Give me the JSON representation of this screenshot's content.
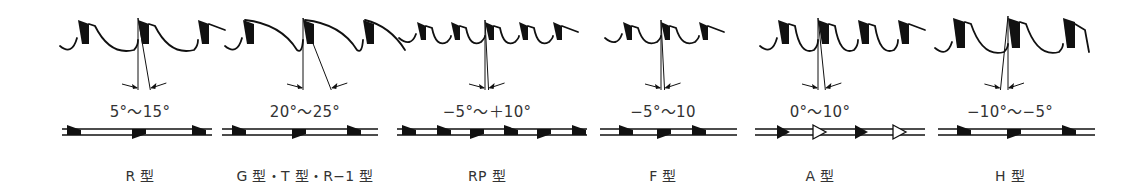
{
  "figure": {
    "ink_color": "#111111",
    "text_color": "#333333",
    "background": "#ffffff"
  },
  "panels": [
    {
      "label": "R 型",
      "angle": "5°～15°",
      "cx": 140,
      "teeth": 3,
      "pitch": 60,
      "rake": 10,
      "style": "standard",
      "plan": [
        {
          "x": 75,
          "side": "top",
          "hollow": false
        },
        {
          "x": 140,
          "side": "bottom",
          "hollow": false
        },
        {
          "x": 200,
          "side": "top",
          "hollow": false
        }
      ],
      "plan_range": [
        62,
        212
      ]
    },
    {
      "label": "G 型・T 型・R−1 型",
      "angle": "20°～25°",
      "cx": 305,
      "teeth": 3,
      "pitch": 60,
      "rake": 22,
      "style": "long",
      "plan": [
        {
          "x": 240,
          "side": "top",
          "hollow": false
        },
        {
          "x": 300,
          "side": "bottom",
          "hollow": false
        },
        {
          "x": 355,
          "side": "top",
          "hollow": false
        }
      ],
      "plan_range": [
        222,
        378
      ]
    },
    {
      "label": "RP 型",
      "angle": "−5°～＋10°",
      "cx": 487,
      "teeth": 5,
      "pitch": 34,
      "rake": 3,
      "style": "standard",
      "plan": [
        {
          "x": 410,
          "side": "top",
          "hollow": false
        },
        {
          "x": 445,
          "side": "top",
          "hollow": false
        },
        {
          "x": 478,
          "side": "bottom",
          "hollow": false
        },
        {
          "x": 512,
          "side": "top",
          "hollow": false
        },
        {
          "x": 545,
          "side": "bottom",
          "hollow": false
        },
        {
          "x": 580,
          "side": "top",
          "hollow": false
        }
      ],
      "plan_range": [
        397,
        587
      ]
    },
    {
      "label": "F 型",
      "angle": "−5°～10",
      "cx": 663,
      "teeth": 3,
      "pitch": 38,
      "rake": 3,
      "style": "standard",
      "plan": [
        {
          "x": 627,
          "side": "top",
          "hollow": false
        },
        {
          "x": 665,
          "side": "bottom",
          "hollow": false
        },
        {
          "x": 700,
          "side": "top",
          "hollow": false
        }
      ],
      "plan_range": [
        600,
        737
      ]
    },
    {
      "label": "A 型",
      "angle": "0°～10°",
      "cx": 820,
      "teeth": 4,
      "pitch": 40,
      "rake": 6,
      "style": "standard",
      "plan": [
        {
          "x": 784,
          "side": "center",
          "hollow": false
        },
        {
          "x": 820,
          "side": "center",
          "hollow": true
        },
        {
          "x": 862,
          "side": "center",
          "hollow": false
        },
        {
          "x": 900,
          "side": "center",
          "hollow": true
        }
      ],
      "plan_range": [
        755,
        925
      ]
    },
    {
      "label": "H 型",
      "angle": "−10°～−5°",
      "cx": 1010,
      "teeth": 3,
      "pitch": 55,
      "rake": -6,
      "style": "heavy",
      "plan": [
        {
          "x": 965,
          "side": "top",
          "hollow": false
        },
        {
          "x": 1015,
          "side": "bottom",
          "hollow": false
        },
        {
          "x": 1070,
          "side": "top",
          "hollow": false
        }
      ],
      "plan_range": [
        938,
        1095
      ]
    }
  ]
}
